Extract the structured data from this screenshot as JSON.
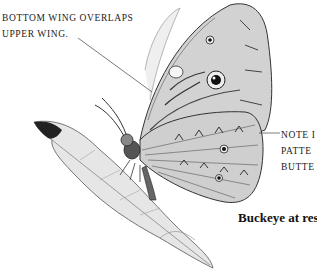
{
  "illustration": {
    "subject": "Buckeye butterfly perched on a leaf",
    "style": "pencil drawing, grayscale"
  },
  "annotations": {
    "top_left": {
      "lines": [
        "BOTTOM WING OVERLAPS",
        "UPPER WING."
      ]
    },
    "right": {
      "lines": [
        "NOTE I",
        "PATTE",
        "BUTTE"
      ]
    }
  },
  "caption": "Buckeye at rest",
  "colors": {
    "background": "#ffffff",
    "ink": "#1a1a1a",
    "shading": "#8a8a8a"
  }
}
